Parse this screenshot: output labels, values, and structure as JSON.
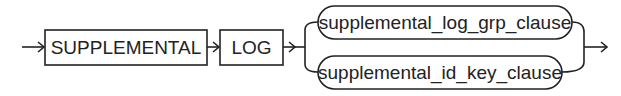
{
  "diagram": {
    "type": "syntax-railroad",
    "keywords": [
      "SUPPLEMENTAL",
      "LOG"
    ],
    "alternatives": [
      "supplemental_log_grp_clause",
      "supplemental_id_key_clause"
    ]
  }
}
